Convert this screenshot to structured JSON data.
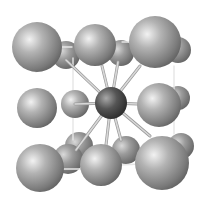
{
  "diagram": {
    "type": "crystal-lattice-unit-cell",
    "background": "#ffffff",
    "colors": {
      "atom_light": "#f2f2f2",
      "atom_mid": "#9a9a9a",
      "atom_dark": "#4a4a4a",
      "center_light": "#bdbdbd",
      "center_dark": "#2e2e2e",
      "bond": "#d8d8d8",
      "edge": "#e6e6e6"
    },
    "atoms_back": [
      {
        "id": "top-left-back",
        "cx": 66,
        "cy": 55,
        "r": 14
      },
      {
        "id": "top-mid-back",
        "cx": 121,
        "cy": 53,
        "r": 13
      },
      {
        "id": "top-right-back",
        "cx": 178,
        "cy": 50,
        "r": 13
      },
      {
        "id": "mid-right-back",
        "cx": 178,
        "cy": 98,
        "r": 12
      },
      {
        "id": "bottom-left-back-upper",
        "cx": 79,
        "cy": 146,
        "r": 14
      },
      {
        "id": "bottom-mid-back",
        "cx": 126,
        "cy": 150,
        "r": 14
      },
      {
        "id": "bottom-right-back",
        "cx": 181,
        "cy": 146,
        "r": 13
      },
      {
        "id": "bottom-left-back",
        "cx": 68,
        "cy": 159,
        "r": 15
      }
    ],
    "atoms_mid": [
      {
        "id": "mid-left-small",
        "cx": 75,
        "cy": 104,
        "r": 14
      }
    ],
    "center_atom": {
      "id": "body-center",
      "cx": 111,
      "cy": 103,
      "r": 16
    },
    "atoms_front": [
      {
        "id": "top-left",
        "cx": 37,
        "cy": 47,
        "r": 25
      },
      {
        "id": "top-mid",
        "cx": 95,
        "cy": 45,
        "r": 21
      },
      {
        "id": "top-right",
        "cx": 155,
        "cy": 42,
        "r": 26
      },
      {
        "id": "mid-left",
        "cx": 37,
        "cy": 108,
        "r": 20
      },
      {
        "id": "mid-right",
        "cx": 159,
        "cy": 105,
        "r": 22
      },
      {
        "id": "bottom-left",
        "cx": 40,
        "cy": 168,
        "r": 24
      },
      {
        "id": "bottom-mid",
        "cx": 101,
        "cy": 165,
        "r": 21
      },
      {
        "id": "bottom-right",
        "cx": 162,
        "cy": 163,
        "r": 27
      }
    ],
    "bonds": [
      {
        "x1": 111,
        "y1": 103,
        "x2": 66,
        "y2": 60
      },
      {
        "x1": 111,
        "y1": 103,
        "x2": 102,
        "y2": 66
      },
      {
        "x1": 111,
        "y1": 103,
        "x2": 118,
        "y2": 62
      },
      {
        "x1": 111,
        "y1": 103,
        "x2": 140,
        "y2": 66
      },
      {
        "x1": 111,
        "y1": 103,
        "x2": 75,
        "y2": 104
      },
      {
        "x1": 111,
        "y1": 103,
        "x2": 138,
        "y2": 104
      },
      {
        "x1": 111,
        "y1": 103,
        "x2": 76,
        "y2": 150
      },
      {
        "x1": 111,
        "y1": 103,
        "x2": 106,
        "y2": 145
      },
      {
        "x1": 111,
        "y1": 103,
        "x2": 121,
        "y2": 140
      },
      {
        "x1": 111,
        "y1": 103,
        "x2": 150,
        "y2": 136
      }
    ],
    "edges": [
      {
        "x1": 36,
        "y1": 47,
        "x2": 72,
        "y2": 47
      },
      {
        "x1": 36,
        "y1": 47,
        "x2": 36,
        "y2": 72
      },
      {
        "x1": 73,
        "y1": 58,
        "x2": 73,
        "y2": 140
      },
      {
        "x1": 122,
        "y1": 42,
        "x2": 132,
        "y2": 42
      },
      {
        "x1": 174,
        "y1": 66,
        "x2": 174,
        "y2": 134
      },
      {
        "x1": 40,
        "y1": 145,
        "x2": 40,
        "y2": 169
      },
      {
        "x1": 40,
        "y1": 169,
        "x2": 82,
        "y2": 169
      },
      {
        "x1": 120,
        "y1": 165,
        "x2": 162,
        "y2": 163
      },
      {
        "x1": 162,
        "y1": 137,
        "x2": 162,
        "y2": 163
      }
    ]
  }
}
